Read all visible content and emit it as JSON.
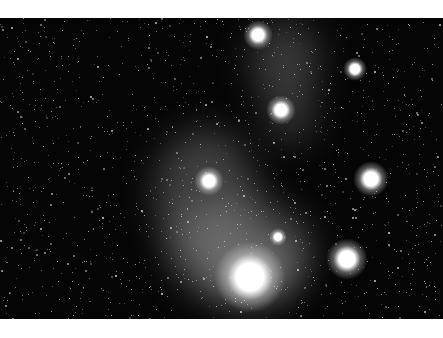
{
  "image": {
    "subject": "star-field-with-nebulae",
    "palette": {
      "background": "#050505",
      "nebula": "#9a9a9a",
      "star": "#ffffff",
      "margin": "#ffffff"
    },
    "bright_stars": [
      {
        "x": 258,
        "y": 35,
        "r": 5
      },
      {
        "x": 355,
        "y": 69,
        "r": 4
      },
      {
        "x": 281,
        "y": 110,
        "r": 5
      },
      {
        "x": 209,
        "y": 181,
        "r": 5
      },
      {
        "x": 371,
        "y": 179,
        "r": 6
      },
      {
        "x": 278,
        "y": 237,
        "r": 3
      },
      {
        "x": 347,
        "y": 259,
        "r": 7
      },
      {
        "x": 250,
        "y": 277,
        "r": 12
      }
    ],
    "nebulae": [
      {
        "x": 250,
        "y": 20,
        "w": 70,
        "h": 80,
        "o": 0.35
      },
      {
        "x": 265,
        "y": 85,
        "w": 50,
        "h": 60,
        "o": 0.3
      },
      {
        "x": 155,
        "y": 130,
        "w": 100,
        "h": 130,
        "o": 0.4
      },
      {
        "x": 170,
        "y": 200,
        "w": 140,
        "h": 100,
        "o": 0.45
      },
      {
        "x": 205,
        "y": 240,
        "w": 90,
        "h": 60,
        "o": 0.55
      }
    ]
  }
}
